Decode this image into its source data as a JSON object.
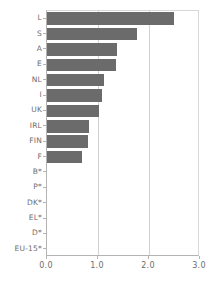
{
  "chart_data": {
    "type": "bar",
    "orientation": "horizontal",
    "title": "",
    "subtitle": "",
    "xlabel": "",
    "ylabel": "",
    "xlim": [
      0.0,
      3.0
    ],
    "xticks": [
      0.0,
      1.0,
      2.0,
      3.0
    ],
    "xtick_labels": [
      "0.0",
      "1.0",
      "2.0",
      "3.0"
    ],
    "grid": "vertical gridlines at 1.0 and 2.0",
    "gridlines": [
      1.0,
      2.0
    ],
    "legend": "none",
    "legend_position": "none",
    "bar_color": "#6b6b6b",
    "axis_color": "#b3b3b3",
    "grid_color": "#d2d2d2",
    "text_color": "#6d6d6d",
    "background": "#ffffff",
    "categories": [
      "L",
      "S",
      "A",
      "E",
      "NL",
      "I",
      "UK",
      "IRL",
      "FIN",
      "F",
      "B*",
      "P*",
      "DK*",
      "EL*",
      "D*",
      "EU-15*"
    ],
    "values": [
      2.49,
      1.76,
      1.38,
      1.35,
      1.12,
      1.08,
      1.02,
      0.82,
      0.8,
      0.68,
      0.0,
      0.0,
      0.0,
      0.0,
      0.0,
      0.0
    ],
    "annotations": [
      "* denotes categories with no data / zero value"
    ]
  }
}
